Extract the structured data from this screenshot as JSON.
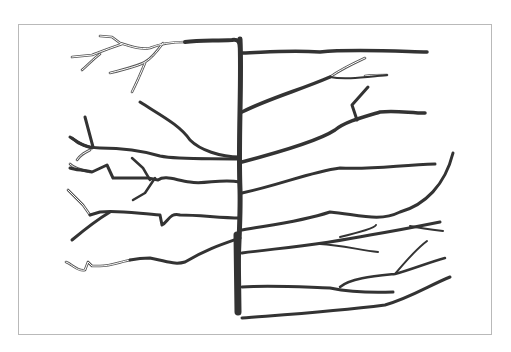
{
  "figure": {
    "type": "branching-line-drawing",
    "frame": {
      "x": 18,
      "y": 24,
      "width": 474,
      "height": 311,
      "border_color": "#b9b9b9"
    },
    "stroke_color": "#333333",
    "trunk": {
      "d": "M240,39 C242,80 238,140 240,190 C241,230 236,270 238,312",
      "width": 5
    },
    "trunk_base": {
      "d": "M237,235 L238,312",
      "width": 7
    },
    "branches_solid": [
      {
        "d": "M185,42 C200,40 215,41 232,40 C238,39 240,42 240,48",
        "w": 4
      },
      {
        "d": "M242,53 C270,52 290,50 320,52 C350,49 390,51 427,52",
        "w": 3.5
      },
      {
        "d": "M242,112 C270,98 300,90 330,77",
        "w": 3.5
      },
      {
        "d": "M330,77 C345,80 365,77 387,75",
        "w": 2
      },
      {
        "d": "M242,162 C280,152 320,140 335,130 C345,122 360,118 380,112 C395,110 410,113 425,113",
        "w": 3.5
      },
      {
        "d": "M357,120 L352,105 L368,87",
        "w": 3
      },
      {
        "d": "M242,193 C280,185 310,172 340,168 C370,170 400,165 435,164",
        "w": 3
      },
      {
        "d": "M242,230 C270,225 300,222 330,212 C360,215 380,222 400,212 C425,205 445,185 453,153",
        "w": 3
      },
      {
        "d": "M242,253 C280,248 320,245 370,235 C400,230 420,226 440,222",
        "w": 3
      },
      {
        "d": "M340,237 C360,232 375,228 376,225",
        "w": 2
      },
      {
        "d": "M410,226 C420,228 435,230 443,231",
        "w": 2
      },
      {
        "d": "M320,244 C340,245 360,250 378,252",
        "w": 2
      },
      {
        "d": "M242,287 C270,285 300,287 330,288 C350,292 370,293 393,292",
        "w": 3
      },
      {
        "d": "M340,287 C350,278 375,276 395,274 C410,270 430,262 445,258",
        "w": 2.5
      },
      {
        "d": "M395,274 C405,262 415,250 427,241",
        "w": 2
      },
      {
        "d": "M242,318 C280,315 330,312 385,305 C410,298 430,285 450,277",
        "w": 3
      },
      {
        "d": "M240,157 C220,157 200,150 190,140 C180,125 160,115 140,102",
        "w": 3
      },
      {
        "d": "M240,159 C210,158 180,160 160,156 C140,150 115,148 100,148 C90,148 80,146 72,138",
        "w": 3
      },
      {
        "d": "M93,147 L85,117",
        "w": 3
      },
      {
        "d": "M92,148 C80,145 75,140 70,137",
        "w": 3
      },
      {
        "d": "M240,182 C220,178 205,185 190,182 C175,180 165,175 158,180 L148,178 C135,178 120,178 113,178 L107,165 L92,172 C85,170 75,170 70,168",
        "w": 3
      },
      {
        "d": "M150,180 L143,168 L132,158",
        "w": 2.5
      },
      {
        "d": "M155,178 L145,193 L133,200",
        "w": 2.5
      },
      {
        "d": "M240,218 C220,218 200,215 180,215 C170,212 168,222 162,225 L160,215 C140,214 120,210 100,212 L90,215",
        "w": 3
      },
      {
        "d": "M110,212 C100,218 90,225 72,240",
        "w": 3
      },
      {
        "d": "M240,238 C220,245 205,250 185,262 C175,265 170,262 150,258 C140,258 130,260 130,260",
        "w": 3
      }
    ],
    "branches_hollow": [
      {
        "d": "M185,42 C170,42 160,44 150,48 C140,50 130,46 120,43 L112,37 L100,36"
      },
      {
        "d": "M163,43 C158,50 152,58 145,62 C140,65 130,68 110,73"
      },
      {
        "d": "M145,63 C142,70 138,80 132,92"
      },
      {
        "d": "M122,44 C110,48 100,52 92,55 L72,57"
      },
      {
        "d": "M100,54 C92,60 88,65 82,70"
      },
      {
        "d": "M90,150 C84,153 80,155 77,160"
      },
      {
        "d": "M90,172 C80,170 74,168 70,164"
      },
      {
        "d": "M90,215 L83,205 L75,197 L68,190"
      },
      {
        "d": "M130,260 C120,262 110,266 100,266 L92,266 L88,262 L85,270 C78,272 72,264 66,262"
      },
      {
        "d": "M330,77 C340,70 350,65 365,58"
      },
      {
        "d": "M365,76 C372,75 380,75 387,75"
      }
    ]
  }
}
